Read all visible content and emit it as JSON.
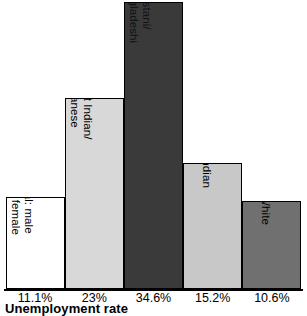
{
  "chart_data": {
    "type": "bar",
    "title": "",
    "xlabel": "Unemployment rate",
    "ylabel": "",
    "grid": false,
    "legend": "none",
    "ylim": [
      0,
      34.6
    ],
    "categories": [
      "Total: male and female",
      "West Indian/ Guyanese",
      "Pakistani/ Bangladeshi",
      "Indian",
      "White"
    ],
    "values": [
      11.1,
      23,
      34.6,
      15.2,
      10.6
    ],
    "tick_labels": [
      "11.1%",
      "23%",
      "34.6%",
      "15.2%",
      "10.6%"
    ],
    "bars": [
      {
        "label_line1": "Total: male",
        "label_line2": "and female",
        "value": 11.1,
        "tick_label": "11.1%",
        "fill": "#ffffff",
        "text_color": "#000000"
      },
      {
        "label_line1": "West Indian/",
        "label_line2": "Guyanese",
        "value": 23,
        "tick_label": "23%",
        "fill": "#d8d8d8",
        "text_color": "#000000"
      },
      {
        "label_line1": "Pakistani/",
        "label_line2": "Bangladeshi",
        "value": 34.6,
        "tick_label": "34.6%",
        "fill": "#3a3a3a",
        "text_color": "#111111"
      },
      {
        "label_line1": "Indian",
        "label_line2": "",
        "value": 15.2,
        "tick_label": "15.2%",
        "fill": "#c8c8c8",
        "text_color": "#000000"
      },
      {
        "label_line1": "White",
        "label_line2": "",
        "value": 10.6,
        "tick_label": "10.6%",
        "fill": "#707070",
        "text_color": "#000000"
      }
    ],
    "axis_color": "#000000",
    "background": "#ffffff"
  }
}
